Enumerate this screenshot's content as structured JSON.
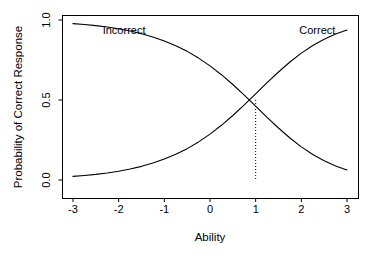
{
  "chart_data": {
    "type": "line",
    "title": "",
    "xlabel": "Ability",
    "ylabel": "Probability of Correct Response",
    "xlim": [
      -3,
      3
    ],
    "ylim": [
      0,
      1
    ],
    "xticks": [
      "-3",
      "-2",
      "-1",
      "0",
      "1",
      "2",
      "3"
    ],
    "xtick_values": [
      -3,
      -2,
      -1,
      0,
      1,
      2,
      3
    ],
    "yticks": [
      "0.0",
      "0.5",
      "1.0"
    ],
    "ytick_values": [
      0.0,
      0.5,
      1.0
    ],
    "grid": false,
    "legend": "none",
    "box": true,
    "line_color": "#000000",
    "background_color": "#ffffff",
    "annotations": [
      {
        "text": "Incorrect",
        "x": -2.35,
        "y": 0.915,
        "anchor": "start"
      },
      {
        "text": "Correct",
        "x": 2.35,
        "y": 0.915,
        "anchor": "middle"
      }
    ],
    "reference_line": {
      "style": "dotted",
      "orientation": "vertical",
      "x": 1,
      "y_from": 0,
      "y_to": 0.5,
      "label": "difficulty b = 1"
    },
    "crossing_point": {
      "x": 1,
      "y": 0.5
    },
    "x": [
      -3,
      -2.75,
      -2.5,
      -2.25,
      -2,
      -1.75,
      -1.5,
      -1.25,
      -1,
      -0.75,
      -0.5,
      -0.25,
      0,
      0.25,
      0.5,
      0.75,
      1,
      1.25,
      1.5,
      1.75,
      2,
      2.25,
      2.5,
      2.75,
      3
    ],
    "series": [
      {
        "name": "Correct",
        "values": [
          0.0225,
          0.0282,
          0.0353,
          0.0442,
          0.0552,
          0.0687,
          0.0854,
          0.1058,
          0.1306,
          0.1604,
          0.196,
          0.238,
          0.2866,
          0.3418,
          0.4031,
          0.4693,
          0.5385,
          0.608,
          0.6751,
          0.7374,
          0.7929,
          0.8406,
          0.8801,
          0.912,
          0.937
        ]
      },
      {
        "name": "Incorrect",
        "values": [
          0.9775,
          0.9718,
          0.9647,
          0.9558,
          0.9448,
          0.9313,
          0.9146,
          0.8942,
          0.8694,
          0.8396,
          0.804,
          0.762,
          0.7134,
          0.6582,
          0.5969,
          0.5307,
          0.4615,
          0.392,
          0.3249,
          0.2626,
          0.2071,
          0.1594,
          0.1199,
          0.088,
          0.063
        ]
      }
    ]
  },
  "figure": {
    "xlabel": "Ability",
    "ylabel": "Probability of Correct Response",
    "xtick_0": "-3",
    "xtick_1": "-2",
    "xtick_2": "-1",
    "xtick_3": "0",
    "xtick_4": "1",
    "xtick_5": "2",
    "xtick_6": "3",
    "ytick_0": "0.0",
    "ytick_1": "0.5",
    "ytick_2": "1.0",
    "annotation_incorrect": "Incorrect",
    "annotation_correct": "Correct"
  }
}
